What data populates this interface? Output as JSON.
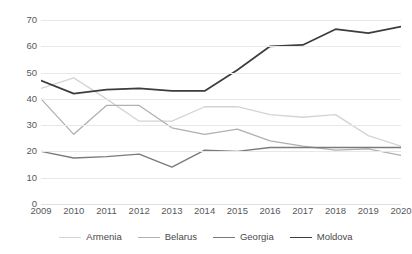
{
  "chart_data": {
    "type": "line",
    "title": "",
    "subtitle": "",
    "xlabel": "",
    "ylabel": "",
    "x": [
      2009,
      2010,
      2011,
      2012,
      2013,
      2014,
      2015,
      2016,
      2017,
      2018,
      2019,
      2020
    ],
    "categories": [
      "2009",
      "2010",
      "2011",
      "2012",
      "2013",
      "2014",
      "2015",
      "2016",
      "2017",
      "2018",
      "2019",
      "2020"
    ],
    "ylim": [
      0,
      70
    ],
    "yticks": [
      0,
      10,
      20,
      30,
      40,
      50,
      60,
      70
    ],
    "ytick_labels": [
      "0",
      "10",
      "20",
      "30",
      "40",
      "50",
      "60",
      "70"
    ],
    "grid": true,
    "grid_axis": "y",
    "legend_position": "bottom",
    "series": [
      {
        "name": "Armenia",
        "color": "#d4d4d4",
        "values": [
          44,
          48,
          40,
          31.5,
          31.5,
          37,
          37,
          34,
          33,
          34,
          26,
          22
        ]
      },
      {
        "name": "Belarus",
        "color": "#b0b0b0",
        "values": [
          40,
          26.5,
          37.5,
          37.5,
          29,
          26.5,
          28.5,
          24,
          22,
          20.5,
          21,
          18.5
        ]
      },
      {
        "name": "Georgia",
        "color": "#7a7a7a",
        "values": [
          20,
          17.5,
          18,
          19,
          14,
          20.5,
          20,
          21.5,
          21.5,
          21.5,
          21.5,
          21.5
        ]
      },
      {
        "name": "Moldova",
        "color": "#3d3d3d",
        "values": [
          47,
          42,
          43.5,
          44,
          43,
          43,
          51,
          60,
          60.5,
          66.5,
          65,
          67.5
        ]
      }
    ]
  },
  "legend": {
    "items": [
      {
        "label": "Armenia"
      },
      {
        "label": "Belarus"
      },
      {
        "label": "Georgia"
      },
      {
        "label": "Moldova"
      }
    ]
  }
}
